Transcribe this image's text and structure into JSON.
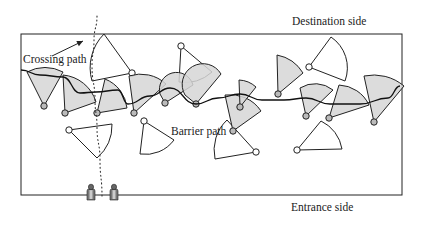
{
  "labels": {
    "destination": "Destination side",
    "entrance": "Entrance side",
    "crossing_path": "Crossing path",
    "barrier_path": "Barrier path"
  },
  "colors": {
    "stroke": "#222222",
    "fill_sector": "#d6d6d6",
    "background": "#ffffff"
  },
  "field": {
    "x": 21,
    "y": 34,
    "width": 381,
    "height": 161
  },
  "shaded_sectors": [
    {
      "apex": [
        44,
        106
      ],
      "p1": [
        27,
        72
      ],
      "p2": [
        63,
        72
      ]
    },
    {
      "apex": [
        65,
        113
      ],
      "p1": [
        63,
        75
      ],
      "p2": [
        96,
        102
      ]
    },
    {
      "apex": [
        97,
        113
      ],
      "p1": [
        105,
        79
      ],
      "p2": [
        127,
        108
      ]
    },
    {
      "apex": [
        134,
        113
      ],
      "p1": [
        129,
        76
      ],
      "p2": [
        166,
        84
      ]
    },
    {
      "apex": [
        165,
        103
      ],
      "p1": [
        160,
        94
      ],
      "p2": [
        193,
        85
      ]
    },
    {
      "apex": [
        196,
        104
      ],
      "p1": [
        185,
        95
      ],
      "p2": [
        221,
        74
      ]
    },
    {
      "apex": [
        233,
        131
      ],
      "p1": [
        225,
        95
      ],
      "p2": [
        261,
        111
      ]
    },
    {
      "apex": [
        240,
        107
      ],
      "p1": [
        239,
        80
      ],
      "p2": [
        256,
        87
      ]
    },
    {
      "apex": [
        278,
        94
      ],
      "p1": [
        277,
        55
      ],
      "p2": [
        303,
        73
      ]
    },
    {
      "apex": [
        306,
        116
      ],
      "p1": [
        300,
        88
      ],
      "p2": [
        333,
        90
      ]
    },
    {
      "apex": [
        329,
        118
      ],
      "p1": [
        339,
        85
      ],
      "p2": [
        369,
        105
      ]
    },
    {
      "apex": [
        374,
        122
      ],
      "p1": [
        364,
        76
      ],
      "p2": [
        404,
        86
      ]
    }
  ],
  "open_sectors": [
    {
      "apex": [
        132,
        73
      ],
      "p1": [
        104,
        34
      ],
      "p2": [
        92,
        81
      ]
    },
    {
      "apex": [
        181,
        46
      ],
      "p1": [
        212,
        72
      ],
      "p2": [
        179,
        82
      ]
    },
    {
      "apex": [
        309,
        67
      ],
      "p1": [
        331,
        37
      ],
      "p2": [
        345,
        81
      ]
    },
    {
      "apex": [
        69,
        130
      ],
      "p1": [
        112,
        124
      ],
      "p2": [
        97,
        158
      ]
    },
    {
      "apex": [
        144,
        121
      ],
      "p1": [
        174,
        140
      ],
      "p2": [
        140,
        154
      ]
    },
    {
      "apex": [
        256,
        152
      ],
      "p1": [
        215,
        159
      ],
      "p2": [
        227,
        120
      ]
    },
    {
      "apex": [
        297,
        150
      ],
      "p1": [
        321,
        121
      ],
      "p2": [
        342,
        149
      ]
    }
  ],
  "barrier_path": [
    [
      21,
      70
    ],
    [
      40,
      75
    ],
    [
      63,
      77
    ],
    [
      80,
      93
    ],
    [
      96,
      92
    ],
    [
      118,
      90
    ],
    [
      128,
      104
    ],
    [
      150,
      96
    ],
    [
      170,
      88
    ],
    [
      196,
      104
    ],
    [
      218,
      98
    ],
    [
      240,
      94
    ],
    [
      262,
      100
    ],
    [
      284,
      100
    ],
    [
      306,
      98
    ],
    [
      330,
      104
    ],
    [
      360,
      104
    ],
    [
      388,
      98
    ],
    [
      400,
      86
    ]
  ],
  "crossing_path": [
    [
      97,
      16
    ],
    [
      94,
      40
    ],
    [
      92,
      66
    ],
    [
      95,
      100
    ],
    [
      97,
      127
    ],
    [
      100,
      160
    ],
    [
      102,
      196
    ]
  ],
  "crossing_arrow": {
    "from": [
      52,
      56
    ],
    "to": [
      83,
      41
    ]
  },
  "pedestrians": [
    {
      "x": 91,
      "y": 196
    },
    {
      "x": 114,
      "y": 196
    }
  ],
  "icons": {
    "pedestrian": "person-icon",
    "sensor": "sensor-node-icon"
  }
}
